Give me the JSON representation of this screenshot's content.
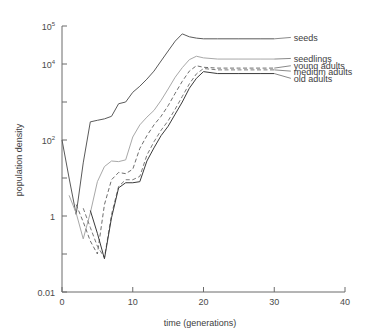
{
  "chart_data": {
    "type": "line",
    "title": "",
    "xlabel": "time (generations)",
    "ylabel": "population density",
    "xlim": [
      0,
      40
    ],
    "ylim": [
      0.01,
      100000
    ],
    "yscale": "log",
    "grid": false,
    "legend_position": "right-inline",
    "xticks": [
      0,
      10,
      20,
      30,
      40
    ],
    "xtick_labels": [
      "0",
      "10",
      "20",
      "30",
      "40"
    ],
    "yticks": [
      0.01,
      0.1,
      1,
      10,
      100,
      1000,
      10000,
      100000
    ],
    "ytick_labels": [
      {
        "base": "0.01",
        "exp": ""
      },
      {
        "base": "",
        "exp": ""
      },
      {
        "base": "1",
        "exp": ""
      },
      {
        "base": "",
        "exp": ""
      },
      {
        "base": "10",
        "exp": "2"
      },
      {
        "base": "",
        "exp": ""
      },
      {
        "base": "10",
        "exp": "4"
      },
      {
        "base": "10",
        "exp": "5"
      }
    ],
    "series": [
      {
        "name": "seeds",
        "label": "seeds",
        "color": "#5a5a5a",
        "dash": "none",
        "width": 1,
        "label_x": 32.2,
        "label_y": 50000,
        "x": [
          0,
          1,
          2,
          3,
          4,
          5,
          6,
          7,
          8,
          9,
          10,
          11,
          12,
          13,
          14,
          15,
          16,
          17,
          18,
          19,
          20,
          22,
          25,
          28,
          30
        ],
        "y": [
          100,
          10,
          1.1,
          25,
          300,
          330,
          360,
          420,
          900,
          1000,
          1800,
          2600,
          4000,
          6500,
          12000,
          22000,
          40000,
          62000,
          52000,
          48000,
          46000,
          46000,
          46000,
          46000,
          46000
        ]
      },
      {
        "name": "seedlings",
        "label": "seedlings",
        "color": "#a8a8a8",
        "dash": "none",
        "width": 1,
        "label_x": 32.2,
        "label_y": 14000,
        "x": [
          1,
          2,
          3,
          4,
          5,
          6,
          7,
          8,
          9,
          10,
          11,
          12,
          13,
          14,
          15,
          16,
          17,
          18,
          19,
          20,
          22,
          25,
          28,
          30
        ],
        "y": [
          3.5,
          1.2,
          0.25,
          1.2,
          8,
          20,
          28,
          27,
          30,
          120,
          250,
          400,
          600,
          1100,
          2200,
          4500,
          8000,
          13000,
          16000,
          14500,
          13500,
          13500,
          13500,
          13500
        ]
      },
      {
        "name": "young adults",
        "label": "young adults",
        "color": "#6e6e6e",
        "dash": "4,2.5",
        "width": 1,
        "label_x": 32.2,
        "label_y": 9000,
        "x": [
          2,
          3,
          4,
          5,
          6,
          7,
          8,
          9,
          10,
          11,
          12,
          13,
          14,
          15,
          16,
          17,
          18,
          19,
          20,
          22,
          25,
          28,
          30
        ],
        "y": [
          2.0,
          0.7,
          0.22,
          0.1,
          2.0,
          9,
          14,
          13,
          17,
          60,
          130,
          250,
          420,
          800,
          1700,
          3500,
          6500,
          9000,
          8200,
          7800,
          7800,
          7800,
          7800
        ]
      },
      {
        "name": "medium adults",
        "label": "medium adults",
        "color": "#7a7a7a",
        "dash": "4,2.5",
        "width": 1,
        "label_x": 32.2,
        "label_y": 6500,
        "x": [
          3,
          4,
          5,
          6,
          7,
          8,
          9,
          10,
          11,
          12,
          13,
          14,
          15,
          16,
          17,
          18,
          19,
          20,
          22,
          25,
          28,
          30
        ],
        "y": [
          1.6,
          0.5,
          0.16,
          0.08,
          1.1,
          6,
          9,
          9,
          11,
          40,
          90,
          180,
          320,
          650,
          1400,
          3000,
          5500,
          7600,
          7000,
          7000,
          7000,
          7000
        ]
      },
      {
        "name": "old adults",
        "label": "old adults",
        "color": "#3a3a3a",
        "dash": "none",
        "width": 1,
        "label_x": 32.2,
        "label_y": 4200,
        "x": [
          4,
          5,
          6,
          7,
          8,
          9,
          10,
          11,
          12,
          13,
          14,
          15,
          16,
          17,
          18,
          19,
          20,
          22,
          25,
          28,
          30
        ],
        "y": [
          1.4,
          0.35,
          0.075,
          0.9,
          5.5,
          7.5,
          7.5,
          8,
          28,
          62,
          130,
          230,
          480,
          1000,
          2300,
          4200,
          6300,
          5600,
          5600,
          5600,
          5600
        ]
      }
    ]
  }
}
